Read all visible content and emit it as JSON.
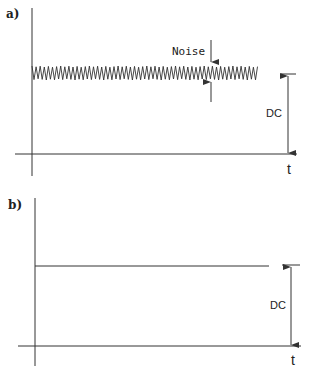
{
  "panels": [
    {
      "id": "a",
      "label": "a)",
      "noise_label": "Noise",
      "dc_label": "DC",
      "time_label": "t",
      "signal": "dc-with-noise"
    },
    {
      "id": "b",
      "label": "b)",
      "dc_label": "DC",
      "time_label": "t",
      "signal": "pure-dc"
    }
  ],
  "colors": {
    "line": "#333333",
    "background": "#ffffff"
  }
}
